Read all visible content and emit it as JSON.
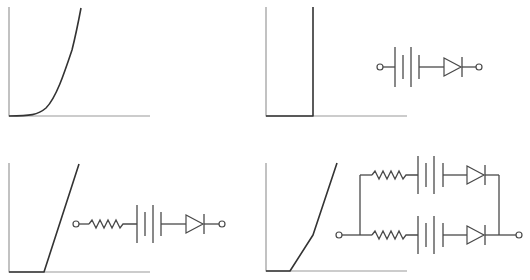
{
  "figure": {
    "panels": [
      {
        "id": "a",
        "graph": "ideal-diode exponential I-V curve",
        "circuit": "none"
      },
      {
        "id": "b",
        "graph": "vertical step at cut-in voltage",
        "circuit": "battery in series with ideal diode"
      },
      {
        "id": "c",
        "graph": "offset linear ramp",
        "circuit": "resistor, battery and ideal diode in series"
      },
      {
        "id": "d",
        "graph": "piecewise-linear curve with breakpoint",
        "circuit": "two parallel branches of resistor, battery and diode"
      }
    ],
    "colors": {
      "axis": "#9a9a9a",
      "curve": "#333333",
      "wire": "#4a4a4a",
      "background": "#ffffff"
    }
  }
}
